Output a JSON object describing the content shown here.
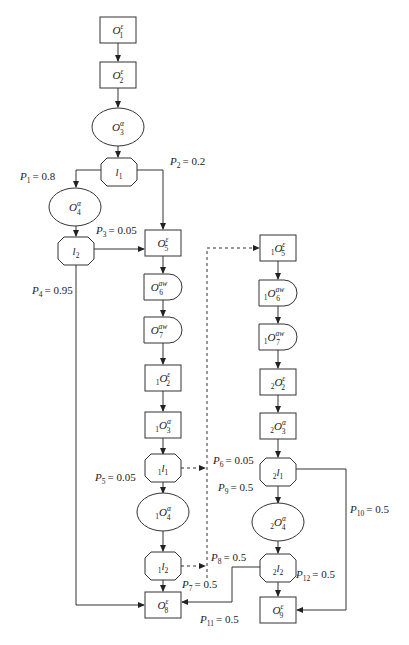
{
  "diagram": {
    "type": "flowchart",
    "nodes": [
      {
        "id": "O1",
        "shape": "rect",
        "prefix": "",
        "base": "O",
        "sub": "1",
        "sup": "ε",
        "cx": 118,
        "cy": 30
      },
      {
        "id": "O2",
        "shape": "rect",
        "prefix": "",
        "base": "O",
        "sub": "2",
        "sup": "ε",
        "cx": 118,
        "cy": 75
      },
      {
        "id": "O3",
        "shape": "ellipse",
        "prefix": "",
        "base": "O",
        "sub": "3",
        "sup": "α",
        "cx": 118,
        "cy": 127
      },
      {
        "id": "l1",
        "shape": "octagon",
        "prefix": "",
        "base": "l",
        "sub": "1",
        "sup": "",
        "cx": 119,
        "cy": 172
      },
      {
        "id": "O4",
        "shape": "ellipse",
        "prefix": "",
        "base": "O",
        "sub": "4",
        "sup": "α",
        "cx": 75,
        "cy": 207
      },
      {
        "id": "l2",
        "shape": "octagon",
        "prefix": "",
        "base": "l",
        "sub": "2",
        "sup": "",
        "cx": 76,
        "cy": 251
      },
      {
        "id": "O5",
        "shape": "rect",
        "prefix": "",
        "base": "O",
        "sub": "5",
        "sup": "ε",
        "cx": 163,
        "cy": 243
      },
      {
        "id": "O6",
        "shape": "delay",
        "prefix": "",
        "base": "O",
        "sub": "6",
        "sup": "aw",
        "cx": 163,
        "cy": 287
      },
      {
        "id": "O7",
        "shape": "delay",
        "prefix": "",
        "base": "O",
        "sub": "7",
        "sup": "aw",
        "cx": 163,
        "cy": 330
      },
      {
        "id": "1O2",
        "shape": "rect",
        "prefix": "1",
        "base": "O",
        "sub": "2",
        "sup": "ε",
        "cx": 163,
        "cy": 378
      },
      {
        "id": "1O3",
        "shape": "rect",
        "prefix": "1",
        "base": "O",
        "sub": "3",
        "sup": "α",
        "cx": 163,
        "cy": 425
      },
      {
        "id": "1l1",
        "shape": "octagon",
        "prefix": "1",
        "base": "l",
        "sub": "1",
        "sup": "",
        "cx": 163,
        "cy": 468
      },
      {
        "id": "1O4",
        "shape": "ellipse",
        "prefix": "1",
        "base": "O",
        "sub": "4",
        "sup": "α",
        "cx": 163,
        "cy": 512
      },
      {
        "id": "1l2",
        "shape": "octagon",
        "prefix": "1",
        "base": "l",
        "sub": "2",
        "sup": "",
        "cx": 163,
        "cy": 566
      },
      {
        "id": "O8",
        "shape": "rect",
        "prefix": "",
        "base": "O",
        "sub": "8",
        "sup": "ε",
        "cx": 163,
        "cy": 605
      },
      {
        "id": "1O5",
        "shape": "rect",
        "prefix": "1",
        "base": "O",
        "sub": "5",
        "sup": "ε",
        "cx": 278,
        "cy": 248
      },
      {
        "id": "1O6",
        "shape": "delay",
        "prefix": "1",
        "base": "O",
        "sub": "6",
        "sup": "aw",
        "cx": 278,
        "cy": 293
      },
      {
        "id": "1O7",
        "shape": "delay",
        "prefix": "1",
        "base": "O",
        "sub": "7",
        "sup": "aw",
        "cx": 278,
        "cy": 337
      },
      {
        "id": "2O2",
        "shape": "rect",
        "prefix": "2",
        "base": "O",
        "sub": "2",
        "sup": "ε",
        "cx": 278,
        "cy": 382
      },
      {
        "id": "2O3",
        "shape": "rect",
        "prefix": "2",
        "base": "O",
        "sub": "3",
        "sup": "α",
        "cx": 278,
        "cy": 426
      },
      {
        "id": "2l1",
        "shape": "octagon",
        "prefix": "2",
        "base": "l",
        "sub": "1",
        "sup": "",
        "cx": 278,
        "cy": 472
      },
      {
        "id": "2O4",
        "shape": "ellipse",
        "prefix": "2",
        "base": "O",
        "sub": "4",
        "sup": "α",
        "cx": 278,
        "cy": 522
      },
      {
        "id": "2l2",
        "shape": "octagon",
        "prefix": "2",
        "base": "l",
        "sub": "2",
        "sup": "",
        "cx": 278,
        "cy": 568
      },
      {
        "id": "O9",
        "shape": "rect",
        "prefix": "",
        "base": "O",
        "sub": "9",
        "sup": "ε",
        "cx": 278,
        "cy": 610
      }
    ],
    "probabilities": [
      {
        "id": "P1",
        "label": "P",
        "sub": "1",
        "value": "= 0.8",
        "x": 20,
        "y": 180
      },
      {
        "id": "P2",
        "label": "P",
        "sub": "2",
        "value": "= 0.2",
        "x": 170,
        "y": 165
      },
      {
        "id": "P3",
        "label": "P",
        "sub": "3",
        "value": "= 0.05",
        "x": 96,
        "y": 234
      },
      {
        "id": "P4",
        "label": "P",
        "sub": "4",
        "value": "= 0.95",
        "x": 32,
        "y": 294
      },
      {
        "id": "P5",
        "label": "P",
        "sub": "5",
        "value": "= 0.05",
        "x": 95,
        "y": 481
      },
      {
        "id": "P6",
        "label": "P",
        "sub": "6",
        "value": "= 0.05",
        "x": 213,
        "y": 464
      },
      {
        "id": "P7",
        "label": "P",
        "sub": "7",
        "value": "= 0.5",
        "x": 182,
        "y": 588
      },
      {
        "id": "P8",
        "label": "P",
        "sub": "8",
        "value": "= 0.5",
        "x": 211,
        "y": 561
      },
      {
        "id": "P9",
        "label": "P",
        "sub": "9",
        "value": "= 0.5",
        "x": 218,
        "y": 491
      },
      {
        "id": "P10",
        "label": "P",
        "sub": "10",
        "value": "= 0.5",
        "x": 350,
        "y": 513
      },
      {
        "id": "P11",
        "label": "P",
        "sub": "11",
        "value": "= 0.5",
        "x": 200,
        "y": 623
      },
      {
        "id": "P12",
        "label": "P",
        "sub": "12",
        "value": "= 0.5",
        "x": 296,
        "y": 578
      }
    ]
  }
}
